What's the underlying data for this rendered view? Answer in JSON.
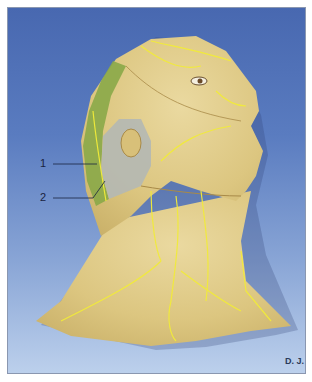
{
  "figure": {
    "colors": {
      "background_top": "#4868b0",
      "background_bottom": "#bcd0ec",
      "skin": "#e3cf8a",
      "nerve": "#f2ec3a",
      "zone1_green": "#8aa848",
      "zone2_gray": "#b4b8b4",
      "border": "#8a97b0"
    },
    "labels": [
      {
        "id": "1",
        "text": "1"
      },
      {
        "id": "2",
        "text": "2"
      }
    ],
    "credit": "D. J."
  }
}
